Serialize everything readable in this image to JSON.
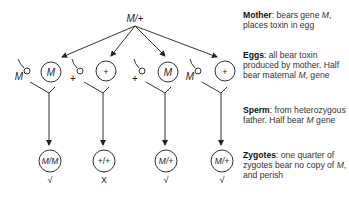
{
  "parent": {
    "label": "M/+"
  },
  "eggs": [
    {
      "label": "M",
      "sperm": "M"
    },
    {
      "label": "+",
      "sperm": "+"
    },
    {
      "label": "M",
      "sperm": "+"
    },
    {
      "label": "+",
      "sperm": "M"
    }
  ],
  "zygotes": [
    {
      "label": "M/M",
      "fate": "√"
    },
    {
      "label": "+/+",
      "fate": "X"
    },
    {
      "label": "M/+",
      "fate": "√"
    },
    {
      "label": "M/+",
      "fate": "√"
    }
  ],
  "legend": {
    "mother": {
      "title": "Mother",
      "text1": ": bears gene ",
      "text2": "M",
      "text3": ", places toxin in egg"
    },
    "eggs": {
      "title": "Eggs",
      "text1": ": all bear toxin produced by mother. Half bear maternal ",
      "text2": "M",
      "text3": ", gene"
    },
    "sperm": {
      "title": "Sperm",
      "text1": ": from heterozygous father. Half bear ",
      "text2": "M",
      "text3": " gene"
    },
    "zygotes": {
      "title": "Zygotes",
      "text1": ": one quarter of zygotes bear no copy of ",
      "text2": "M",
      "text3": ", and perish"
    }
  }
}
